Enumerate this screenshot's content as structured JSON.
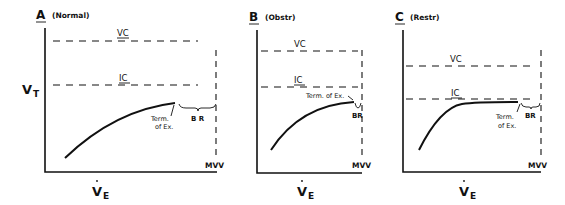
{
  "figure": {
    "y_axis_label": "V",
    "y_axis_sub": "T",
    "x_axis_label": "V",
    "x_axis_sub": "E",
    "lines": {
      "vc": "VC",
      "ic": "IC",
      "mvv": "MVV",
      "br": "B R",
      "br_compact": "BR",
      "term_line1": "Term.",
      "term_line2": "of Ex.",
      "term_inline": "Term. of Ex."
    },
    "panels": [
      {
        "letter": "A",
        "subtitle": "(Normal)"
      },
      {
        "letter": "B",
        "subtitle": "(Obstr)"
      },
      {
        "letter": "C",
        "subtitle": "(Restr)"
      }
    ]
  }
}
